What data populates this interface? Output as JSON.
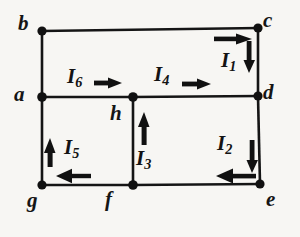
{
  "figure": {
    "kind": "circuit-diagram",
    "background_color": "#f7f6f3",
    "line_color": "#151515",
    "node_color": "#111111",
    "nodes": [
      {
        "id": "b",
        "label": "b",
        "x": 42,
        "y": 31,
        "label_x": 18,
        "label_y": 13
      },
      {
        "id": "c",
        "label": "c",
        "x": 258,
        "y": 28,
        "label_x": 263,
        "label_y": 10
      },
      {
        "id": "a",
        "label": "a",
        "x": 42,
        "y": 97,
        "label_x": 14,
        "label_y": 84
      },
      {
        "id": "d",
        "label": "d",
        "x": 258,
        "y": 96,
        "label_x": 263,
        "label_y": 82
      },
      {
        "id": "h",
        "label": "h",
        "x": 133,
        "y": 97,
        "label_x": 110,
        "label_y": 103
      },
      {
        "id": "g",
        "label": "g",
        "x": 42,
        "y": 185,
        "label_x": 27,
        "label_y": 190
      },
      {
        "id": "f",
        "label": "f",
        "x": 133,
        "y": 185,
        "label_x": 105,
        "label_y": 189
      },
      {
        "id": "e",
        "label": "e",
        "x": 260,
        "y": 184,
        "label_x": 266,
        "label_y": 189
      }
    ],
    "edges": [
      {
        "from": "b",
        "to": "c"
      },
      {
        "from": "b",
        "to": "a"
      },
      {
        "from": "a",
        "to": "h"
      },
      {
        "from": "h",
        "to": "d"
      },
      {
        "from": "c",
        "to": "d"
      },
      {
        "from": "d",
        "to": "e"
      },
      {
        "from": "a",
        "to": "g"
      },
      {
        "from": "h",
        "to": "f"
      },
      {
        "from": "g",
        "to": "f"
      },
      {
        "from": "f",
        "to": "e"
      }
    ],
    "currents": [
      {
        "id": "I1",
        "name": "I",
        "subscript": "1",
        "label_x": 221,
        "label_y": 50,
        "branch": "c-d",
        "arrows": [
          {
            "dir": "right",
            "x1": 214,
            "y1": 39,
            "x2": 252,
            "y2": 39
          },
          {
            "dir": "down",
            "x1": 249,
            "y1": 41,
            "x2": 249,
            "y2": 73
          }
        ]
      },
      {
        "id": "I2",
        "name": "I",
        "subscript": "2",
        "label_x": 217,
        "label_y": 133,
        "branch": "d-e-f",
        "arrows": [
          {
            "dir": "down",
            "x1": 252,
            "y1": 140,
            "x2": 252,
            "y2": 173
          },
          {
            "dir": "left",
            "x1": 255,
            "y1": 176,
            "x2": 216,
            "y2": 176
          }
        ]
      },
      {
        "id": "I3",
        "name": "I",
        "subscript": "3",
        "label_x": 136,
        "label_y": 148,
        "branch": "f-h",
        "arrows": [
          {
            "dir": "up",
            "x1": 144,
            "y1": 144,
            "x2": 144,
            "y2": 112
          }
        ]
      },
      {
        "id": "I4",
        "name": "I",
        "subscript": "4",
        "label_x": 154,
        "label_y": 64,
        "branch": "h-d",
        "arrows": [
          {
            "dir": "right",
            "x1": 182,
            "y1": 84,
            "x2": 211,
            "y2": 84
          }
        ]
      },
      {
        "id": "I5",
        "name": "I",
        "subscript": "5",
        "label_x": 64,
        "label_y": 137,
        "branch": "g-a",
        "arrows": [
          {
            "dir": "up",
            "x1": 50,
            "y1": 166,
            "x2": 50,
            "y2": 138
          },
          {
            "dir": "left",
            "x1": 91,
            "y1": 176,
            "x2": 56,
            "y2": 176
          }
        ]
      },
      {
        "id": "I6",
        "name": "I",
        "subscript": "6",
        "label_x": 67,
        "label_y": 66,
        "branch": "a-h",
        "arrows": [
          {
            "dir": "right",
            "x1": 94,
            "y1": 83,
            "x2": 122,
            "y2": 83
          }
        ]
      }
    ]
  }
}
